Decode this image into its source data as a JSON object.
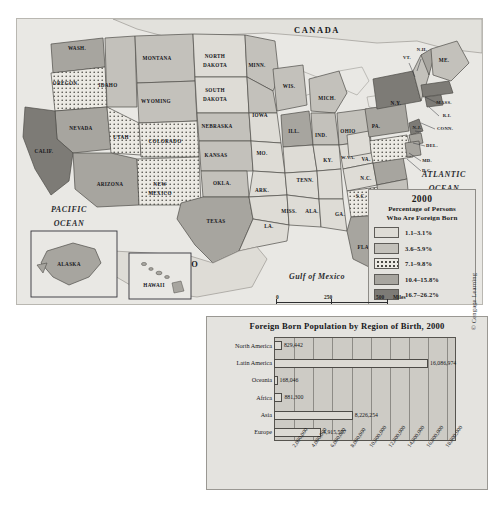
{
  "map": {
    "oceans": [
      {
        "name": "PACIFIC OCEAN",
        "line1": "PACIFIC",
        "line2": "OCEAN"
      },
      {
        "name": "ATLANTIC OCEAN",
        "line1": "ATLANTIC",
        "line2": "OCEAN"
      }
    ],
    "gulf_label": "Gulf of Mexico",
    "countries": [
      "CANADA",
      "MEXICO"
    ],
    "states": [
      {
        "label": "WASH.",
        "x": 60,
        "y": 30,
        "cls": "c4",
        "size": "sm"
      },
      {
        "label": "OREGON",
        "x": 48,
        "y": 65,
        "cls": "c3",
        "size": "sm"
      },
      {
        "label": "IDAHO",
        "x": 91,
        "y": 67,
        "cls": "c2",
        "size": "sm"
      },
      {
        "label": "MONTANA",
        "x": 140,
        "y": 40,
        "cls": "c2",
        "size": "sm"
      },
      {
        "label": "WYOMING",
        "x": 139,
        "y": 83,
        "cls": "c2",
        "size": "sm"
      },
      {
        "label": "NEVADA",
        "x": 64,
        "y": 110,
        "cls": "c4",
        "size": "sm"
      },
      {
        "label": "CALIF.",
        "x": 27,
        "y": 133,
        "cls": "c5",
        "size": "sm"
      },
      {
        "label": "UTAH",
        "x": 104,
        "y": 119,
        "cls": "c3",
        "size": "sm"
      },
      {
        "label": "COLORADO",
        "x": 148,
        "y": 123,
        "cls": "c3",
        "size": "sm"
      },
      {
        "label": "ARIZONA",
        "x": 93,
        "y": 166,
        "cls": "c4",
        "size": "sm"
      },
      {
        "label": "NEW",
        "x": 143,
        "y": 166,
        "cls": "c3",
        "size": "sm"
      },
      {
        "label": "MEXICO",
        "x": 143,
        "y": 175,
        "cls": "c3",
        "size": "sm"
      },
      {
        "label": "NORTH",
        "x": 198,
        "y": 38,
        "cls": "c1",
        "size": "sm"
      },
      {
        "label": "DAKOTA",
        "x": 198,
        "y": 47,
        "cls": "c1",
        "size": "sm"
      },
      {
        "label": "SOUTH",
        "x": 198,
        "y": 72,
        "cls": "c1",
        "size": "sm"
      },
      {
        "label": "DAKOTA",
        "x": 198,
        "y": 81,
        "cls": "c1",
        "size": "sm"
      },
      {
        "label": "MINN.",
        "x": 240,
        "y": 47,
        "cls": "c2",
        "size": "sm"
      },
      {
        "label": "NEBRASKA",
        "x": 200,
        "y": 108,
        "cls": "c2",
        "size": "sm"
      },
      {
        "label": "IOWA",
        "x": 243,
        "y": 97,
        "cls": "c2",
        "size": "sm"
      },
      {
        "label": "KANSAS",
        "x": 199,
        "y": 137,
        "cls": "c2",
        "size": "sm"
      },
      {
        "label": "MO.",
        "x": 245,
        "y": 135,
        "cls": "c1",
        "size": "sm"
      },
      {
        "label": "WIS.",
        "x": 272,
        "y": 68,
        "cls": "c2",
        "size": "sm"
      },
      {
        "label": "ILL.",
        "x": 277,
        "y": 113,
        "cls": "c4",
        "size": "sm"
      },
      {
        "label": "MICH.",
        "x": 310,
        "y": 80,
        "cls": "c2",
        "size": "sm"
      },
      {
        "label": "IND.",
        "x": 304,
        "y": 117,
        "cls": "c2",
        "size": "sm"
      },
      {
        "label": "OHIO",
        "x": 331,
        "y": 113,
        "cls": "c2",
        "size": "sm"
      },
      {
        "label": "OKLA.",
        "x": 205,
        "y": 165,
        "cls": "c2",
        "size": "sm"
      },
      {
        "label": "ARK.",
        "x": 245,
        "y": 172,
        "cls": "c1",
        "size": "sm"
      },
      {
        "label": "TEXAS",
        "x": 199,
        "y": 203,
        "cls": "c4",
        "size": "sm"
      },
      {
        "label": "LA.",
        "x": 252,
        "y": 208,
        "cls": "c1",
        "size": "sm"
      },
      {
        "label": "MISS.",
        "x": 272,
        "y": 193,
        "cls": "c1",
        "size": "sm"
      },
      {
        "label": "ALA.",
        "x": 295,
        "y": 193,
        "cls": "c1",
        "size": "sm"
      },
      {
        "label": "TENN.",
        "x": 288,
        "y": 162,
        "cls": "c1",
        "size": "sm"
      },
      {
        "label": "KY.",
        "x": 311,
        "y": 142,
        "cls": "c1",
        "size": "sm"
      },
      {
        "label": "GA.",
        "x": 323,
        "y": 196,
        "cls": "c3",
        "size": "sm"
      },
      {
        "label": "FLA.",
        "x": 347,
        "y": 229,
        "cls": "c4",
        "size": "sm"
      },
      {
        "label": "S.C.",
        "x": 344,
        "y": 178,
        "cls": "c2",
        "size": "sm"
      },
      {
        "label": "N.C.",
        "x": 349,
        "y": 160,
        "cls": "c4",
        "size": "sm"
      },
      {
        "label": "VA.",
        "x": 349,
        "y": 141,
        "cls": "c3",
        "size": "sm"
      },
      {
        "label": "W.VA.",
        "x": 331,
        "y": 139,
        "cls": "c1",
        "size": "xs"
      },
      {
        "label": "PA.",
        "x": 359,
        "y": 108,
        "cls": "c4",
        "size": "sm"
      },
      {
        "label": "N.Y.",
        "x": 379,
        "y": 85,
        "cls": "c5",
        "size": "sm"
      },
      {
        "label": "VT.",
        "x": 390,
        "y": 39,
        "cls": "c2",
        "size": "xs"
      },
      {
        "label": "N.H.",
        "x": 405,
        "y": 31,
        "cls": "c4",
        "size": "xs"
      },
      {
        "label": "ME.",
        "x": 427,
        "y": 42,
        "cls": "c2",
        "size": "sm"
      },
      {
        "label": "MASS.",
        "x": 427,
        "y": 84,
        "cls": "c5",
        "size": "xs"
      },
      {
        "label": "R.I.",
        "x": 430,
        "y": 97,
        "cls": "c5",
        "size": "xs"
      },
      {
        "label": "CONN.",
        "x": 428,
        "y": 110,
        "cls": "c5",
        "size": "xs"
      },
      {
        "label": "N.J.",
        "x": 400,
        "y": 109,
        "cls": "c5",
        "size": "xs"
      },
      {
        "label": "DEL.",
        "x": 415,
        "y": 127,
        "cls": "c4",
        "size": "xs"
      },
      {
        "label": "MD.",
        "x": 410,
        "y": 142,
        "cls": "c4",
        "size": "xs"
      },
      {
        "label": "D.C.",
        "x": 410,
        "y": 152,
        "cls": "c4",
        "size": "xs"
      }
    ],
    "insets": [
      {
        "name": "ALASKA",
        "label": "ALASKA"
      },
      {
        "name": "HAWAII",
        "label": "HAWAII"
      }
    ],
    "scale": {
      "miles": {
        "unit": "Miles",
        "ticks": [
          "0",
          "250",
          "500"
        ]
      },
      "kilometers": {
        "unit": "Kilometers",
        "ticks": [
          "0",
          "250",
          "500"
        ]
      }
    }
  },
  "legend": {
    "year": "2000",
    "title_line1": "Percentage of Persons",
    "title_line2": "Who Are Foreign Born",
    "items": [
      {
        "label": "1.1–3.1%",
        "cls": "c1",
        "dots": false
      },
      {
        "label": "3.6–5.9%",
        "cls": "c2",
        "dots": false
      },
      {
        "label": "7.1–9.8%",
        "cls": "c3",
        "dots": true
      },
      {
        "label": "10.4–15.8%",
        "cls": "c4",
        "dots": false
      },
      {
        "label": "16.7–26.2%",
        "cls": "c5",
        "dots": false
      }
    ]
  },
  "chart_data": {
    "type": "bar",
    "orientation": "horizontal",
    "title": "Foreign Born Population by Region of Birth, 2000",
    "categories": [
      "North America",
      "Latin America",
      "Oceania",
      "Africa",
      "Asia",
      "Europe"
    ],
    "values": [
      829442,
      16086974,
      168046,
      881300,
      8226254,
      4915557
    ],
    "value_labels": [
      "829,442",
      "16,086,974",
      "168,046",
      "881,300",
      "8,226,254",
      "4,915,557"
    ],
    "xlabel": "",
    "ylabel": "",
    "xlim": [
      0,
      19000000
    ],
    "tick_labels": [
      "2,000,000",
      "4,000,000",
      "6,000,000",
      "8,000,000",
      "10,000,000",
      "12,000,000",
      "14,000,000",
      "16,000,000",
      "18,000,000"
    ],
    "tick_values": [
      2000000,
      4000000,
      6000000,
      8000000,
      10000000,
      12000000,
      14000000,
      16000000,
      18000000
    ],
    "grid": true,
    "legend": "none"
  },
  "credit": "© Cengage Learning"
}
